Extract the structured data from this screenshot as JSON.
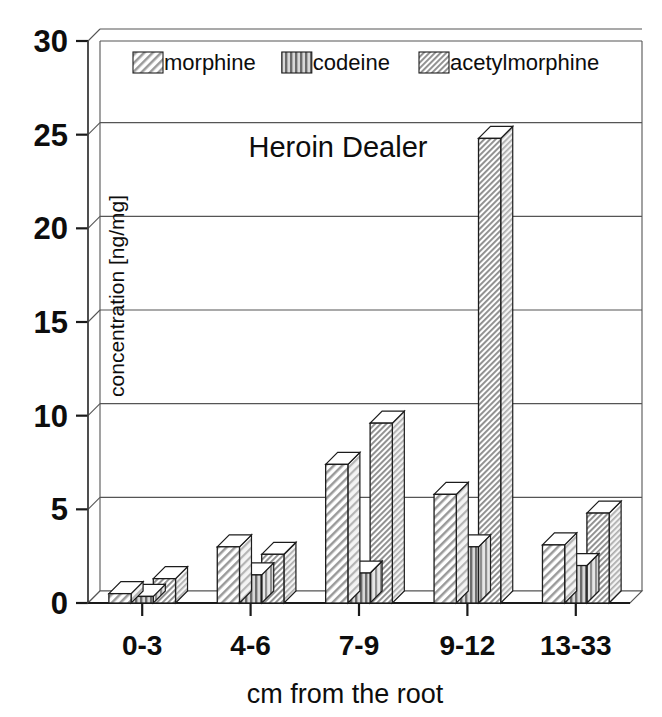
{
  "figure": {
    "title": "Heroin Dealer",
    "background": "#ffffff",
    "ink_color": "#101010"
  },
  "legend": {
    "position": "top-inside",
    "entries": [
      {
        "label": "morphine",
        "pattern": "diagonal-hatch",
        "color": "#c9c9c9"
      },
      {
        "label": "codeine",
        "pattern": "vertical-hatch",
        "color": "#8f8f8f"
      },
      {
        "label": "acetylmorphine",
        "pattern": "fine-diagonal-hatch",
        "color": "#b5b5b5"
      }
    ]
  },
  "axes": {
    "y_title": "concentration [ng/mg]",
    "x_title": "cm from the root",
    "y_ticks": [
      "0",
      "5",
      "10",
      "15",
      "20",
      "25",
      "30"
    ],
    "x_ticks": [
      "0-3",
      "4-6",
      "7-9",
      "9-12",
      "13-33"
    ]
  },
  "chart_data": {
    "type": "bar",
    "title": "Heroin Dealer",
    "xlabel": "cm from the root",
    "ylabel": "concentration [ng/mg]",
    "categories": [
      "0-3",
      "4-6",
      "7-9",
      "9-12",
      "13-33"
    ],
    "series": [
      {
        "name": "morphine",
        "values": [
          0.5,
          3.0,
          7.4,
          5.8,
          3.1
        ]
      },
      {
        "name": "codeine",
        "values": [
          0.35,
          1.5,
          1.6,
          3.0,
          2.0
        ]
      },
      {
        "name": "acetylmorphine",
        "values": [
          1.3,
          2.6,
          9.6,
          24.8,
          4.8
        ]
      }
    ],
    "ylim": [
      0,
      30
    ],
    "ytick_step": 5,
    "grid": true,
    "legend_position": "top-inside",
    "style": "3d-grouped-bars-grayscale"
  }
}
